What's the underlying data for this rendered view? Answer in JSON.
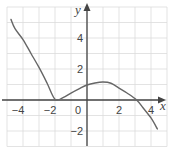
{
  "chart_data": {
    "type": "line",
    "title": "",
    "xlabel": "x",
    "ylabel": "y",
    "xlim": [
      -5,
      5
    ],
    "ylim": [
      -3,
      6
    ],
    "grid": true,
    "legend": null,
    "x_tick_labels": [
      {
        "value": -4,
        "label": "−4"
      },
      {
        "value": -2,
        "label": "−2"
      },
      {
        "value": 0,
        "label": "0"
      },
      {
        "value": 2,
        "label": "2"
      },
      {
        "value": 4,
        "label": "4"
      }
    ],
    "y_tick_labels": [
      {
        "value": 4,
        "label": "4"
      },
      {
        "value": 2,
        "label": "2"
      },
      {
        "value": -2,
        "label": "−2"
      }
    ],
    "series": [
      {
        "name": "curve",
        "color": "#666666",
        "x": [
          -4.75,
          -4.5,
          -4,
          -3.5,
          -3,
          -2.5,
          -2,
          -1.5,
          -1,
          -0.5,
          0,
          0.5,
          1,
          1.5,
          2,
          2.5,
          3.1,
          3.5,
          4,
          4.4
        ],
        "y": [
          5.2,
          4.6,
          3.9,
          3.0,
          2.1,
          1.1,
          0.05,
          0.15,
          0.45,
          0.72,
          0.97,
          1.1,
          1.16,
          1.08,
          0.77,
          0.45,
          0.0,
          -0.5,
          -1.16,
          -1.87
        ]
      }
    ],
    "annotations": [
      "local minimum touching x-axis at x = -2",
      "local maximum near (1, 1.16)",
      "x-intercept near x = 3"
    ]
  },
  "colors": {
    "grid": "#dcdcdc",
    "axis": "#444444",
    "curve": "#666666",
    "background": "#ffffff"
  }
}
